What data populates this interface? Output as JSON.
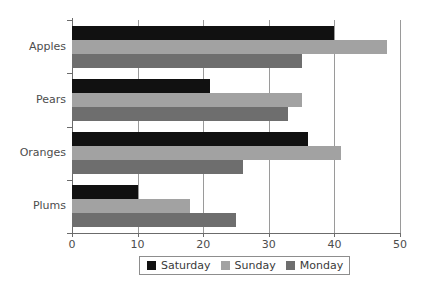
{
  "chart_data": {
    "type": "bar",
    "orientation": "horizontal",
    "title": "",
    "subtitle": "",
    "xlabel": "",
    "ylabel": "",
    "categories": [
      "Apples",
      "Pears",
      "Oranges",
      "Plums"
    ],
    "series": [
      {
        "name": "Saturday",
        "color": "#111111",
        "values": [
          40,
          21,
          36,
          10
        ]
      },
      {
        "name": "Sunday",
        "color": "#a2a2a2",
        "values": [
          48,
          35,
          41,
          18
        ]
      },
      {
        "name": "Monday",
        "color": "#6e6e6e",
        "values": [
          35,
          33,
          26,
          25
        ]
      }
    ],
    "xlim": [
      0,
      50
    ],
    "xticks": [
      0,
      10,
      20,
      30,
      40,
      50
    ],
    "xtick_labels": [
      "0",
      "10",
      "20",
      "30",
      "40",
      "50"
    ],
    "grid": true,
    "grid_axis": "x",
    "legend_position": "bottom",
    "legend_entries": [
      "Saturday",
      "Sunday",
      "Monday"
    ],
    "axis_color": "#6b6b6b",
    "gridline_color": "#9a9a9a",
    "label_color": "#4d4d4d",
    "background": "#ffffff"
  }
}
